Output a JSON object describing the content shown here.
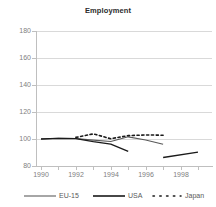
{
  "chart_data": {
    "type": "line",
    "title": "Employment",
    "xlabel": "",
    "ylabel": "",
    "grid": true,
    "legend_position": "bottom",
    "xlim": [
      1990,
      1999
    ],
    "ylim": [
      80,
      180
    ],
    "yticks": [
      180,
      160,
      140,
      120,
      100,
      80
    ],
    "xticks": [
      1990,
      1992,
      1994,
      1996,
      1998
    ],
    "series": [
      {
        "name": "EU-15",
        "style": "solid",
        "color": "#595959",
        "x": [
          1990,
          1991,
          1992,
          1993,
          1994,
          1995,
          1996,
          1997
        ],
        "values": [
          100,
          100.6,
          100.4,
          99.2,
          98.1,
          101.6,
          99.2,
          96.1
        ]
      },
      {
        "name": "USA",
        "style": "solid",
        "color": "#1a1a1a",
        "x": [
          1990,
          1991,
          1992,
          1993,
          1994,
          1995
        ],
        "values": [
          100,
          100.4,
          100.3,
          98.0,
          96.2,
          90.8
        ]
      },
      {
        "name": "Japan",
        "style": "dotted",
        "color": "#1a1a1a",
        "x": [
          1992,
          1993,
          1994,
          1995,
          1996,
          1997
        ],
        "values": [
          101.2,
          103.8,
          100.2,
          102.5,
          103.0,
          102.8
        ]
      },
      {
        "name": "segment-tail",
        "style": "solid",
        "color": "#1a1a1a",
        "x": [
          1997,
          1999
        ],
        "values": [
          86.3,
          90.2
        ]
      }
    ]
  },
  "legend": {
    "items": [
      {
        "label": "EU-15",
        "style": "solid",
        "color": "#808080"
      },
      {
        "label": "USA",
        "style": "solid",
        "color": "#1a1a1a"
      },
      {
        "label": "Japan",
        "style": "dotted",
        "color": "#1a1a1a"
      }
    ]
  },
  "axis": {
    "y_tick_labels": [
      "180",
      "160",
      "140",
      "120",
      "100",
      "80"
    ],
    "x_tick_labels": [
      "1990",
      "1992",
      "1994",
      "1996",
      "1998"
    ]
  }
}
